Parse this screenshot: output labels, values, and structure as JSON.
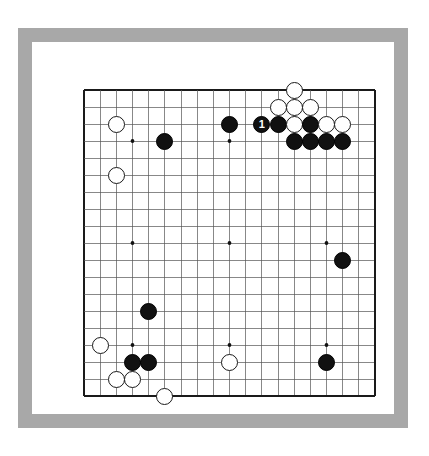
{
  "page": {
    "background_color": "#ffffff",
    "frame_color": "#a8a8a8",
    "paper_color": "#ffffff"
  },
  "board": {
    "type": "go-board",
    "size": 19,
    "line_color": "#555555",
    "border_color": "#1a1a1a",
    "star_point_color": "#111111",
    "star_points": [
      {
        "col": 4,
        "row": 4
      },
      {
        "col": 10,
        "row": 4
      },
      {
        "col": 16,
        "row": 4
      },
      {
        "col": 4,
        "row": 10
      },
      {
        "col": 10,
        "row": 10
      },
      {
        "col": 16,
        "row": 10
      },
      {
        "col": 4,
        "row": 16
      },
      {
        "col": 10,
        "row": 16
      },
      {
        "col": 16,
        "row": 16
      }
    ],
    "black_color": "#111111",
    "white_color": "#ffffff",
    "stones": [
      {
        "col": 14,
        "row": 1,
        "color": "white",
        "label": ""
      },
      {
        "col": 13,
        "row": 2,
        "color": "white",
        "label": ""
      },
      {
        "col": 14,
        "row": 2,
        "color": "white",
        "label": ""
      },
      {
        "col": 15,
        "row": 2,
        "color": "white",
        "label": ""
      },
      {
        "col": 12,
        "row": 3,
        "color": "black",
        "label": "1"
      },
      {
        "col": 13,
        "row": 3,
        "color": "black",
        "label": ""
      },
      {
        "col": 14,
        "row": 3,
        "color": "white",
        "label": ""
      },
      {
        "col": 15,
        "row": 3,
        "color": "black",
        "label": ""
      },
      {
        "col": 16,
        "row": 3,
        "color": "white",
        "label": ""
      },
      {
        "col": 17,
        "row": 3,
        "color": "white",
        "label": ""
      },
      {
        "col": 14,
        "row": 4,
        "color": "black",
        "label": ""
      },
      {
        "col": 15,
        "row": 4,
        "color": "black",
        "label": ""
      },
      {
        "col": 16,
        "row": 4,
        "color": "black",
        "label": ""
      },
      {
        "col": 17,
        "row": 4,
        "color": "black",
        "label": ""
      },
      {
        "col": 10,
        "row": 3,
        "color": "black",
        "label": ""
      },
      {
        "col": 3,
        "row": 3,
        "color": "white",
        "label": ""
      },
      {
        "col": 6,
        "row": 4,
        "color": "black",
        "label": ""
      },
      {
        "col": 3,
        "row": 6,
        "color": "white",
        "label": ""
      },
      {
        "col": 17,
        "row": 11,
        "color": "black",
        "label": ""
      },
      {
        "col": 5,
        "row": 14,
        "color": "black",
        "label": ""
      },
      {
        "col": 2,
        "row": 16,
        "color": "white",
        "label": ""
      },
      {
        "col": 4,
        "row": 17,
        "color": "black",
        "label": ""
      },
      {
        "col": 5,
        "row": 17,
        "color": "black",
        "label": ""
      },
      {
        "col": 10,
        "row": 17,
        "color": "white",
        "label": ""
      },
      {
        "col": 16,
        "row": 17,
        "color": "black",
        "label": ""
      },
      {
        "col": 3,
        "row": 18,
        "color": "white",
        "label": ""
      },
      {
        "col": 4,
        "row": 18,
        "color": "white",
        "label": ""
      },
      {
        "col": 6,
        "row": 19,
        "color": "white",
        "label": ""
      }
    ],
    "move_markers": [
      {
        "number": "1",
        "col": 12,
        "row": 3,
        "color": "black"
      }
    ]
  }
}
